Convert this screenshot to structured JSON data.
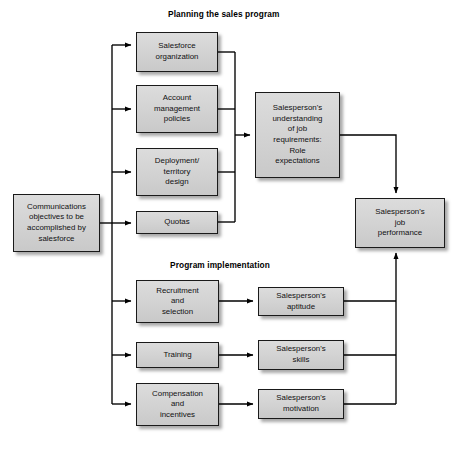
{
  "diagram": {
    "titles": [
      {
        "id": "planning",
        "text": "Planning the sales program"
      },
      {
        "id": "implementation",
        "text": "Program implementation"
      }
    ],
    "nodes": {
      "communications_objectives": "Communications\nobjectives to be\naccomplished by\nsalesforce",
      "salesforce_organization": "Salesforce\norganization",
      "account_management_policies": "Account\nmanagement\npolicies",
      "deployment_territory_design": "Deployment/\nterritory\ndesign",
      "quotas": "Quotas",
      "role_expectations": "Salesperson's\nunderstanding\nof job\nrequirements:\nRole\nexpectations",
      "job_performance": "Salesperson's\njob\nperformance",
      "recruitment_and_selection": "Recruitment\nand\nselection",
      "training": "Training",
      "compensation_and_incentives": "Compensation\nand\nincentives",
      "aptitude": "Salesperson's\naptitude",
      "skills": "Salesperson's\nskills",
      "motivation": "Salesperson's\nmotivation"
    },
    "colors": {
      "node_fill": "#d4d4d4",
      "node_border": "#1a1a1a",
      "edge": "#000000",
      "background": "#ffffff",
      "text": "#111111"
    }
  }
}
